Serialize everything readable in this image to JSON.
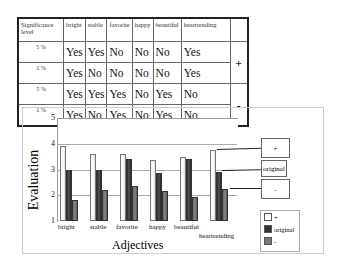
{
  "table": {
    "header": [
      "Significance level",
      "bright",
      "stable",
      "favorite",
      "happy",
      "beautiful",
      "heartrending"
    ],
    "rows": [
      {
        "level": "5 %",
        "values": [
          "Yes",
          "Yes",
          "No",
          "No",
          "No",
          "Yes"
        ],
        "sign": "+"
      },
      {
        "level": "1 %",
        "values": [
          "Yes",
          "No",
          "No",
          "No",
          "No",
          "Yes"
        ],
        "sign": ""
      },
      {
        "level": "5 %",
        "values": [
          "Yes",
          "Yes",
          "Yes",
          "No",
          "Yes",
          "No"
        ],
        "sign": "-"
      },
      {
        "level": "1 %",
        "values": [
          "Yes",
          "No",
          "Yes",
          "No",
          "Yes",
          "No"
        ],
        "sign": ""
      }
    ]
  },
  "chart_data": {
    "type": "bar",
    "title": "",
    "xlabel": "Adjectives",
    "ylabel": "Evaluation",
    "ylim": [
      1,
      5
    ],
    "yticks": [
      "1",
      "2",
      "3",
      "4",
      "5"
    ],
    "categories": [
      "bright",
      "stable",
      "favorite",
      "happy",
      "beautiful",
      "heartrending"
    ],
    "series": [
      {
        "name": "+",
        "values": [
          3.9,
          3.6,
          3.6,
          3.35,
          3.5,
          3.75
        ]
      },
      {
        "name": "original",
        "values": [
          3.0,
          3.0,
          3.4,
          2.85,
          3.4,
          2.9
        ]
      },
      {
        "name": "-",
        "values": [
          1.8,
          2.2,
          2.35,
          2.15,
          1.95,
          2.25
        ]
      }
    ],
    "callouts": [
      "+",
      "original",
      "-"
    ],
    "legend": [
      "+",
      "original",
      "-"
    ],
    "legend_position": "bottom-right",
    "grid": true
  }
}
